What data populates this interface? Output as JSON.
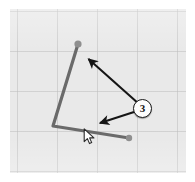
{
  "app": {
    "title": "Drawing Canvas Annotation",
    "canvas_name": "polyline-sketch-canvas"
  },
  "canvas": {
    "background_color": "#e9e9e9",
    "grid_color": "#bebebe",
    "grid_spacing": 40,
    "border_color": "#ffffff",
    "width": 176,
    "height": 164
  },
  "shape": {
    "name": "open-polyline",
    "stroke_color": "#6a6a6a",
    "stroke_width": 3,
    "node_color": "#8f8f8f",
    "points": [
      {
        "label": "node-top",
        "x": 78,
        "y": 44
      },
      {
        "label": "vertex-bottom-left",
        "x": 53,
        "y": 126
      },
      {
        "label": "node-bottom-right",
        "x": 129,
        "y": 138
      }
    ]
  },
  "annotations": {
    "arrow_color": "#151515",
    "arrows": [
      {
        "name": "arrow-to-top-node",
        "from_x": 139,
        "from_y": 104,
        "to_x": 86,
        "to_y": 57
      },
      {
        "name": "arrow-to-bottom-segment",
        "from_x": 134,
        "from_y": 112,
        "to_x": 97,
        "to_y": 124
      }
    ],
    "badge": {
      "name": "step-badge",
      "value": "3",
      "fill": "#fdfdfd",
      "border": "#1b1b1b",
      "x": 143,
      "y": 109
    }
  },
  "cursor": {
    "name": "mouse-pointer",
    "x": 88,
    "y": 132,
    "fill": "#ffffff",
    "stroke": "#2a2a2a"
  }
}
